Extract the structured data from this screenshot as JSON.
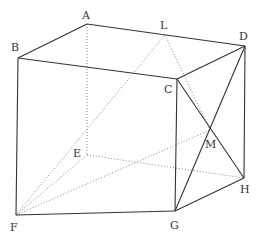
{
  "points": {
    "A": {
      "x": 87,
      "y": 24,
      "label": "A",
      "lx": 82,
      "ly": 19
    },
    "B": {
      "x": 18,
      "y": 58,
      "label": "B",
      "lx": 11,
      "ly": 51
    },
    "C": {
      "x": 177,
      "y": 79,
      "label": "C",
      "lx": 164,
      "ly": 93
    },
    "D": {
      "x": 245,
      "y": 46,
      "label": "D",
      "lx": 239,
      "ly": 40
    },
    "E": {
      "x": 87,
      "y": 155,
      "label": "E",
      "lx": 73,
      "ly": 157
    },
    "F": {
      "x": 16,
      "y": 215,
      "label": "F",
      "lx": 10,
      "ly": 231
    },
    "G": {
      "x": 175,
      "y": 211,
      "label": "G",
      "lx": 170,
      "ly": 229
    },
    "H": {
      "x": 244,
      "y": 178,
      "label": "H",
      "lx": 240,
      "ly": 193
    },
    "L": {
      "x": 165,
      "y": 35,
      "label": "L",
      "lx": 160,
      "ly": 29
    },
    "M": {
      "x": 210,
      "y": 130,
      "label": "M",
      "lx": 205,
      "ly": 148
    }
  },
  "solid_edges": [
    [
      "A",
      "B"
    ],
    [
      "B",
      "C"
    ],
    [
      "C",
      "D"
    ],
    [
      "A",
      "D"
    ],
    [
      "B",
      "F"
    ],
    [
      "F",
      "G"
    ],
    [
      "G",
      "H"
    ],
    [
      "D",
      "H"
    ],
    [
      "C",
      "G"
    ],
    [
      "C",
      "H"
    ],
    [
      "D",
      "G"
    ]
  ],
  "dotted_edges": [
    [
      "A",
      "E"
    ],
    [
      "E",
      "F"
    ],
    [
      "E",
      "H"
    ],
    [
      "F",
      "M"
    ],
    [
      "F",
      "L"
    ],
    [
      "L",
      "M"
    ]
  ],
  "colors": {
    "line": "#333333",
    "hidden": "#777777",
    "background": "#ffffff"
  }
}
